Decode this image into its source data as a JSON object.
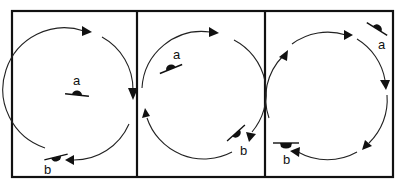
{
  "figure": {
    "type": "three-panel rotation diagram",
    "panels": [
      {
        "id": 1,
        "labels": {
          "a": "a",
          "b": "b"
        },
        "rotation": "clockwise",
        "object_a_position": "center",
        "object_b_position": "bottom-left on circle"
      },
      {
        "id": 2,
        "labels": {
          "a": "a",
          "b": "b"
        },
        "rotation": "clockwise",
        "object_a_position": "upper-left inside circle",
        "object_b_position": "lower-right on circle"
      },
      {
        "id": 3,
        "labels": {
          "a": "a",
          "b": "b"
        },
        "rotation": "clockwise",
        "object_a_position": "top-right outside circle",
        "object_b_position": "bottom-left on circle"
      }
    ],
    "colors": {
      "ink": "#111111",
      "background": "#ffffff"
    }
  }
}
